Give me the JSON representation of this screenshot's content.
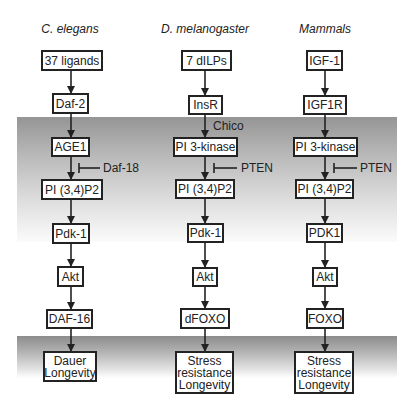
{
  "columns": [
    {
      "title": "C. elegans",
      "nodes": [
        "37 ligands",
        "Daf-2",
        "AGE1",
        "PI (3,4)P2",
        "Pdk-1",
        "Akt",
        "DAF-16",
        "Dauer\nLongevity"
      ],
      "inhibitor": "Daf-18",
      "adaptor": null
    },
    {
      "title": "D. melanogaster",
      "nodes": [
        "7 dILPs",
        "InsR",
        "PI 3-kinase",
        "PI (3,4)P2",
        "Pdk-1",
        "Akt",
        "dFOXO",
        "Stress\nresistance\nLongevity"
      ],
      "inhibitor": "PTEN",
      "adaptor": "Chico"
    },
    {
      "title": "Mammals",
      "nodes": [
        "IGF-1",
        "IGF1R",
        "PI 3-kinase",
        "PI (3,4)P2",
        "PDK1",
        "Akt",
        "FOXO",
        "Stress\nresistance\nLongevity"
      ],
      "inhibitor": "PTEN",
      "adaptor": null
    }
  ],
  "colors": {
    "band_top": "#959595",
    "band_lower_top": "#8c8c8c",
    "box_border": "#222222",
    "box_fill": "#ffffff"
  }
}
